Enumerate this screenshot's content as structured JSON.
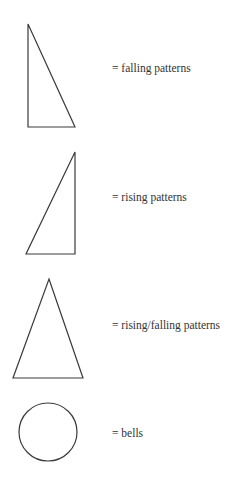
{
  "figure": {
    "top_remnant_text": "",
    "stroke_color": "#3a3a3a",
    "background": "#ffffff",
    "legend": [
      {
        "shape": "right-triangle-falling",
        "label": "= falling patterns"
      },
      {
        "shape": "right-triangle-rising",
        "label": "= rising patterns"
      },
      {
        "shape": "isosceles-triangle",
        "label": "= rising/falling patterns"
      },
      {
        "shape": "circle",
        "label": "= bells"
      }
    ]
  }
}
